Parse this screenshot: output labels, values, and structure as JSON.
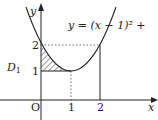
{
  "figure": {
    "equation_label": "y = (x − 1)² +",
    "region_label": "D",
    "region_subscript": "1",
    "axis_x_label": "x",
    "axis_y_label": "y",
    "origin_label": "O",
    "x_ticks": [
      "1",
      "2"
    ],
    "y_ticks": [
      "1",
      "2"
    ],
    "curve": "parabola y = (x-1)^2 + 1",
    "shaded_region": "between curve, y=1 and x=0 for 0≤x≤1",
    "line_color": "#222222",
    "hatch_color": "#333333"
  }
}
